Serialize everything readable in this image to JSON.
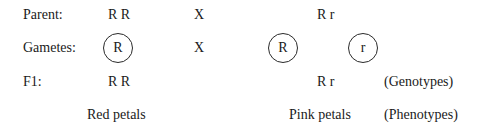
{
  "rows": {
    "parent": {
      "label": "Parent:",
      "left": "R R",
      "cross": "X",
      "right": "R r"
    },
    "gametes": {
      "label": "Gametes:",
      "left": [
        "R"
      ],
      "cross": "X",
      "right": [
        "R",
        "r"
      ]
    },
    "f1": {
      "label": "F1:",
      "left": "R R",
      "right": "R r",
      "note": "(Genotypes)"
    },
    "phenotype": {
      "left": "Red petals",
      "right": "Pink petals",
      "note": "(Phenotypes)"
    }
  }
}
